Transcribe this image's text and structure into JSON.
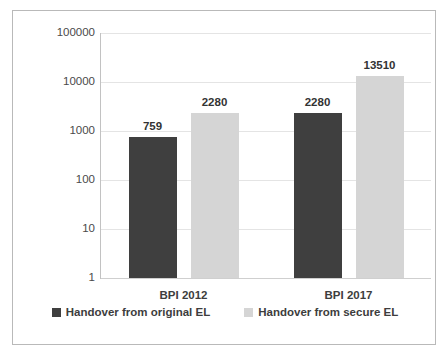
{
  "chart_data": {
    "type": "bar",
    "title": "",
    "xlabel": "",
    "ylabel": "",
    "scale": "log",
    "ylim": [
      1,
      100000
    ],
    "grid": true,
    "legend_position": "bottom",
    "categories": [
      "BPI 2012",
      "BPI 2017"
    ],
    "y_ticks": [
      "1",
      "10",
      "100",
      "1000",
      "10000",
      "100000"
    ],
    "y_tick_values": [
      1,
      10,
      100,
      1000,
      10000,
      100000
    ],
    "series": [
      {
        "name": "Handover from original EL",
        "color": "#3f3f3f",
        "values": [
          759,
          2280
        ],
        "value_labels": [
          "759",
          "7230"
        ]
      },
      {
        "name": "Handover from secure EL",
        "color": "#d5d5d5",
        "values": [
          2280,
          13510
        ],
        "value_labels": [
          "2280",
          "13510"
        ]
      }
    ],
    "data_labels": {
      "bpi_2012_original": "759",
      "bpi_2012_secure": "2280",
      "bpi_2017_original": "7230",
      "bpi_2017_secure": "13510"
    },
    "plot_values": [
      {
        "category": "BPI 2012",
        "series": "Handover from original EL",
        "value": 759
      },
      {
        "category": "BPI 2012",
        "series": "Handover from secure EL",
        "value": 2280
      },
      {
        "category": "BPI 2017",
        "series": "Handover from original EL",
        "value": 7230
      },
      {
        "category": "BPI 2017",
        "series": "Handover from secure EL",
        "value": 13510
      }
    ]
  },
  "legend": {
    "entries": [
      {
        "label": "Handover from original EL",
        "color": "#3f3f3f"
      },
      {
        "label": "Handover from secure EL",
        "color": "#d5d5d5"
      }
    ]
  },
  "colors": {
    "series_dark": "#3f3f3f",
    "series_light": "#d5d5d5",
    "gridline": "#e4e4e4",
    "border": "#b9b9b9",
    "text": "#3d3d3d",
    "background": "#ffffff"
  }
}
